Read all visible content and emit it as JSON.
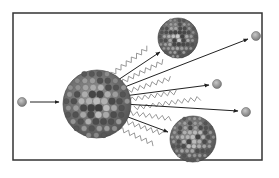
{
  "diagram": {
    "type": "nuclear-fission",
    "frame": {
      "x": 13,
      "y": 13,
      "width": 249,
      "height": 147,
      "stroke": "#333333"
    },
    "colors": {
      "neutron_fill": "#9a9a9a",
      "neutron_stroke": "#6e6e6e",
      "nucleus_dark": "#4a4a4a",
      "nucleus_light": "#a8a8a8",
      "arrow": "#222222",
      "gamma": "#8c8c8c"
    },
    "incoming_neutron": {
      "cx": 22,
      "cy": 102,
      "r": 4.5
    },
    "incoming_arrow": {
      "x1": 30,
      "y1": 102,
      "x2": 59,
      "y2": 102
    },
    "parent_nucleus": {
      "cx": 97,
      "cy": 104,
      "r": 34
    },
    "fragments": [
      {
        "name": "fragment-top",
        "cx": 178,
        "cy": 38,
        "r": 20
      },
      {
        "name": "fragment-bottom",
        "cx": 193,
        "cy": 139,
        "r": 23
      }
    ],
    "released_neutrons": [
      {
        "name": "neutron-1",
        "cx": 256,
        "cy": 36,
        "r": 4.5
      },
      {
        "name": "neutron-2",
        "cx": 217,
        "cy": 84,
        "r": 4.5
      },
      {
        "name": "neutron-3",
        "cx": 246,
        "cy": 112,
        "r": 4.5
      }
    ],
    "arrows": [
      {
        "name": "arrow-to-fragment-top",
        "x1": 118,
        "y1": 80,
        "x2": 160,
        "y2": 52
      },
      {
        "name": "arrow-to-neutron-1",
        "x1": 122,
        "y1": 88,
        "x2": 248,
        "y2": 39
      },
      {
        "name": "arrow-to-neutron-2",
        "x1": 124,
        "y1": 96,
        "x2": 209,
        "y2": 85
      },
      {
        "name": "arrow-to-neutron-3",
        "x1": 124,
        "y1": 104,
        "x2": 238,
        "y2": 111
      },
      {
        "name": "arrow-to-fragment-bottom",
        "x1": 120,
        "y1": 114,
        "x2": 168,
        "y2": 132
      }
    ],
    "gamma_rays": [
      {
        "x1": 112,
        "y1": 74,
        "x2": 150,
        "y2": 46
      },
      {
        "x1": 118,
        "y1": 84,
        "x2": 166,
        "y2": 60
      },
      {
        "x1": 122,
        "y1": 93,
        "x2": 172,
        "y2": 78
      },
      {
        "x1": 126,
        "y1": 100,
        "x2": 178,
        "y2": 92
      },
      {
        "x1": 134,
        "y1": 108,
        "x2": 203,
        "y2": 98
      },
      {
        "x1": 124,
        "y1": 112,
        "x2": 172,
        "y2": 119
      },
      {
        "x1": 120,
        "y1": 120,
        "x2": 164,
        "y2": 134
      },
      {
        "x1": 116,
        "y1": 127,
        "x2": 156,
        "y2": 145
      }
    ]
  }
}
